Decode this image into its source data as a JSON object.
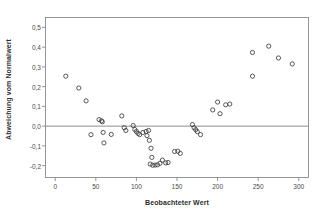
{
  "chart_data": {
    "type": "scatter",
    "title": "",
    "xlabel": "Beobachteter Wert",
    "ylabel": "Abweichung vom Normalwert",
    "xlim": [
      -12,
      312
    ],
    "ylim": [
      -0.26,
      0.55
    ],
    "xticks": [
      0,
      50,
      100,
      150,
      200,
      250,
      300
    ],
    "xticklabels": [
      "0",
      "50",
      "100",
      "150",
      "200",
      "250",
      "300"
    ],
    "yticks": [
      0.5,
      0.4,
      0.3,
      0.2,
      0.1,
      0.0,
      -0.1,
      -0.2
    ],
    "yticklabels": [
      "0,5",
      "0,4",
      "0,3",
      "0,2",
      "0,1",
      "0,0",
      "-0,1",
      "-0,2"
    ],
    "grid": false,
    "legend": null,
    "reference_line": {
      "axis": "y",
      "value": 0.0,
      "color": "#808080"
    },
    "marker": {
      "shape": "circle-open",
      "edge_color": "#3c3c3c",
      "face_color": "none",
      "size_px": 4.2
    },
    "frame_color": "#8a8a8a",
    "points": [
      {
        "x": 13,
        "y": 0.253
      },
      {
        "x": 29,
        "y": 0.193
      },
      {
        "x": 38,
        "y": 0.128
      },
      {
        "x": 44,
        "y": -0.043
      },
      {
        "x": 54,
        "y": 0.033
      },
      {
        "x": 57,
        "y": 0.027
      },
      {
        "x": 58,
        "y": 0.022
      },
      {
        "x": 59,
        "y": -0.032
      },
      {
        "x": 60,
        "y": -0.085
      },
      {
        "x": 69,
        "y": -0.042
      },
      {
        "x": 82,
        "y": 0.052
      },
      {
        "x": 85,
        "y": -0.008
      },
      {
        "x": 87,
        "y": -0.022
      },
      {
        "x": 96,
        "y": 0.003
      },
      {
        "x": 98,
        "y": -0.017
      },
      {
        "x": 100,
        "y": -0.027
      },
      {
        "x": 102,
        "y": -0.037
      },
      {
        "x": 104,
        "y": -0.043
      },
      {
        "x": 108,
        "y": -0.032
      },
      {
        "x": 112,
        "y": -0.027
      },
      {
        "x": 115,
        "y": -0.022
      },
      {
        "x": 113,
        "y": -0.048
      },
      {
        "x": 116,
        "y": -0.072
      },
      {
        "x": 118,
        "y": -0.112
      },
      {
        "x": 119,
        "y": -0.158
      },
      {
        "x": 117,
        "y": -0.192
      },
      {
        "x": 120,
        "y": -0.198
      },
      {
        "x": 123,
        "y": -0.197
      },
      {
        "x": 126,
        "y": -0.196
      },
      {
        "x": 129,
        "y": -0.188
      },
      {
        "x": 132,
        "y": -0.172
      },
      {
        "x": 136,
        "y": -0.186
      },
      {
        "x": 139,
        "y": -0.184
      },
      {
        "x": 147,
        "y": -0.128
      },
      {
        "x": 151,
        "y": -0.127
      },
      {
        "x": 154,
        "y": -0.138
      },
      {
        "x": 169,
        "y": 0.008
      },
      {
        "x": 171,
        "y": -0.008
      },
      {
        "x": 173,
        "y": -0.018
      },
      {
        "x": 175,
        "y": -0.028
      },
      {
        "x": 179,
        "y": -0.043
      },
      {
        "x": 194,
        "y": 0.082
      },
      {
        "x": 200,
        "y": 0.122
      },
      {
        "x": 203,
        "y": 0.063
      },
      {
        "x": 210,
        "y": 0.108
      },
      {
        "x": 215,
        "y": 0.112
      },
      {
        "x": 243,
        "y": 0.373
      },
      {
        "x": 243,
        "y": 0.253
      },
      {
        "x": 263,
        "y": 0.405
      },
      {
        "x": 275,
        "y": 0.345
      },
      {
        "x": 292,
        "y": 0.315
      }
    ]
  }
}
